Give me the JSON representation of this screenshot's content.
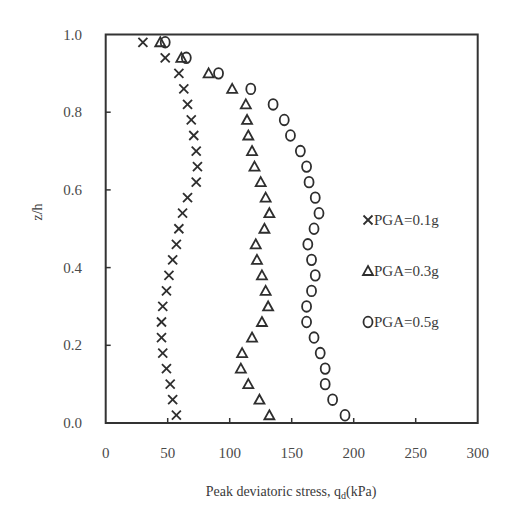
{
  "chart_data": {
    "type": "scatter",
    "title": "",
    "xlabel": "Peak deviatoric stress, q_d(kPa)",
    "xlabel_main": "Peak deviatoric stress,  q",
    "xlabel_sub": "d",
    "xlabel_tail": "(kPa)",
    "ylabel": "z/h",
    "xlim": [
      0,
      300
    ],
    "ylim": [
      0.0,
      1.0
    ],
    "x_ticks": [
      0,
      50,
      100,
      150,
      200,
      250,
      300
    ],
    "x_tick_labels": [
      "0",
      "50",
      "100",
      "150",
      "200",
      "250",
      "300"
    ],
    "y_ticks": [
      0.0,
      0.2,
      0.4,
      0.6,
      0.8,
      1.0
    ],
    "y_tick_labels": [
      "0.0",
      "0.2",
      "0.4",
      "0.6",
      "0.8",
      "1.0"
    ],
    "grid": false,
    "legend_position": "right-center inside plot",
    "y": [
      0.98,
      0.94,
      0.9,
      0.86,
      0.82,
      0.78,
      0.74,
      0.7,
      0.66,
      0.62,
      0.58,
      0.54,
      0.5,
      0.46,
      0.42,
      0.38,
      0.34,
      0.3,
      0.26,
      0.22,
      0.18,
      0.14,
      0.1,
      0.06,
      0.02
    ],
    "series": [
      {
        "name": "PGA=0.1g",
        "marker": "x",
        "x": [
          30,
          48,
          59,
          63,
          66,
          69,
          71,
          73,
          74,
          73,
          66,
          62,
          59,
          57,
          54,
          51,
          49,
          46,
          45,
          45,
          46,
          49,
          52,
          54,
          57
        ]
      },
      {
        "name": "PGA=0.3g",
        "marker": "triangle",
        "x": [
          44,
          61,
          83,
          102,
          113,
          114,
          115,
          118,
          120,
          125,
          129,
          132,
          128,
          121,
          122,
          126,
          129,
          131,
          126,
          118,
          110,
          109,
          115,
          124,
          132
        ]
      },
      {
        "name": "PGA=0.5g",
        "marker": "circle",
        "x": [
          48,
          65,
          91,
          117,
          135,
          144,
          149,
          157,
          162,
          164,
          169,
          172,
          168,
          163,
          166,
          169,
          166,
          162,
          162,
          168,
          173,
          177,
          177,
          183,
          193
        ]
      }
    ]
  },
  "legend": {
    "items": [
      {
        "label": "PGA=0.1g",
        "marker": "x-icon"
      },
      {
        "label": "PGA=0.3g",
        "marker": "triangle-icon"
      },
      {
        "label": "PGA=0.5g",
        "marker": "circle-icon"
      }
    ]
  },
  "colors": {
    "marker": "#2e2e2e",
    "frame": "#333333",
    "text": "#444444"
  }
}
